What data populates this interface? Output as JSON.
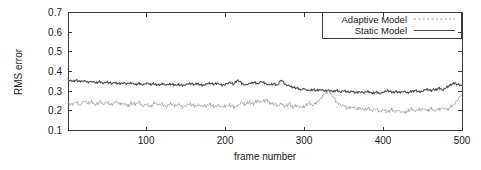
{
  "chart_data": {
    "type": "line",
    "title": "",
    "xlabel": "frame number",
    "ylabel": "RMS error",
    "xlim": [
      1,
      500
    ],
    "ylim": [
      0.1,
      0.7
    ],
    "grid": false,
    "legend_position": "top-right",
    "xticks": [
      100,
      200,
      300,
      400,
      500
    ],
    "xtick_labels": [
      "100",
      "200",
      "300",
      "400",
      "500"
    ],
    "yticks": [
      0.1,
      0.2,
      0.3,
      0.4,
      0.5,
      0.6,
      0.7
    ],
    "ytick_labels": [
      "0.1",
      "0.2",
      "0.3",
      "0.4",
      "0.5",
      "0.6",
      "0.7"
    ],
    "series": [
      {
        "name": "Adaptive Model",
        "style": "dotted",
        "color": "#9a9a9a",
        "x": [
          1,
          6,
          11,
          16,
          21,
          26,
          31,
          36,
          41,
          46,
          51,
          56,
          61,
          66,
          71,
          76,
          81,
          86,
          91,
          96,
          101,
          106,
          111,
          116,
          121,
          126,
          131,
          136,
          141,
          146,
          151,
          156,
          161,
          166,
          171,
          176,
          181,
          186,
          191,
          196,
          201,
          206,
          211,
          216,
          221,
          226,
          231,
          236,
          241,
          246,
          251,
          256,
          261,
          266,
          271,
          276,
          281,
          286,
          291,
          296,
          301,
          306,
          311,
          316,
          321,
          326,
          331,
          336,
          341,
          346,
          351,
          356,
          361,
          366,
          371,
          376,
          381,
          386,
          391,
          396,
          401,
          406,
          411,
          416,
          421,
          426,
          431,
          436,
          441,
          446,
          451,
          456,
          461,
          466,
          471,
          476,
          481,
          486,
          491,
          496,
          500
        ],
        "values": [
          0.24,
          0.228,
          0.246,
          0.232,
          0.251,
          0.237,
          0.244,
          0.23,
          0.248,
          0.236,
          0.242,
          0.229,
          0.247,
          0.234,
          0.24,
          0.226,
          0.238,
          0.231,
          0.243,
          0.227,
          0.235,
          0.222,
          0.24,
          0.228,
          0.234,
          0.221,
          0.238,
          0.226,
          0.232,
          0.219,
          0.229,
          0.236,
          0.224,
          0.231,
          0.218,
          0.227,
          0.235,
          0.222,
          0.229,
          0.216,
          0.224,
          0.233,
          0.22,
          0.228,
          0.241,
          0.23,
          0.246,
          0.235,
          0.252,
          0.243,
          0.255,
          0.246,
          0.238,
          0.228,
          0.236,
          0.224,
          0.232,
          0.22,
          0.228,
          0.217,
          0.225,
          0.238,
          0.226,
          0.246,
          0.262,
          0.285,
          0.302,
          0.275,
          0.248,
          0.232,
          0.224,
          0.212,
          0.22,
          0.208,
          0.216,
          0.205,
          0.213,
          0.201,
          0.209,
          0.198,
          0.206,
          0.196,
          0.204,
          0.194,
          0.202,
          0.192,
          0.2,
          0.208,
          0.198,
          0.206,
          0.212,
          0.202,
          0.21,
          0.2,
          0.208,
          0.216,
          0.206,
          0.222,
          0.238,
          0.262,
          0.281
        ]
      },
      {
        "name": "Static Model",
        "style": "solid",
        "color": "#4a4a4a",
        "x": [
          1,
          6,
          11,
          16,
          21,
          26,
          31,
          36,
          41,
          46,
          51,
          56,
          61,
          66,
          71,
          76,
          81,
          86,
          91,
          96,
          101,
          106,
          111,
          116,
          121,
          126,
          131,
          136,
          141,
          146,
          151,
          156,
          161,
          166,
          171,
          176,
          181,
          186,
          191,
          196,
          201,
          206,
          211,
          216,
          221,
          226,
          231,
          236,
          241,
          246,
          251,
          256,
          261,
          266,
          271,
          276,
          281,
          286,
          291,
          296,
          301,
          306,
          311,
          316,
          321,
          326,
          331,
          336,
          341,
          346,
          351,
          356,
          361,
          366,
          371,
          376,
          381,
          386,
          391,
          396,
          401,
          406,
          411,
          416,
          421,
          426,
          431,
          436,
          441,
          446,
          451,
          456,
          461,
          466,
          471,
          476,
          481,
          486,
          491,
          496,
          500
        ],
        "values": [
          0.36,
          0.352,
          0.357,
          0.348,
          0.353,
          0.345,
          0.35,
          0.343,
          0.348,
          0.341,
          0.346,
          0.339,
          0.344,
          0.338,
          0.343,
          0.336,
          0.341,
          0.335,
          0.34,
          0.334,
          0.339,
          0.333,
          0.338,
          0.332,
          0.337,
          0.331,
          0.336,
          0.33,
          0.335,
          0.329,
          0.334,
          0.34,
          0.332,
          0.338,
          0.33,
          0.336,
          0.342,
          0.334,
          0.339,
          0.331,
          0.337,
          0.343,
          0.335,
          0.355,
          0.341,
          0.333,
          0.339,
          0.345,
          0.337,
          0.348,
          0.34,
          0.332,
          0.338,
          0.33,
          0.356,
          0.336,
          0.328,
          0.321,
          0.314,
          0.306,
          0.312,
          0.304,
          0.31,
          0.302,
          0.308,
          0.3,
          0.306,
          0.298,
          0.304,
          0.296,
          0.302,
          0.294,
          0.3,
          0.292,
          0.298,
          0.291,
          0.297,
          0.29,
          0.296,
          0.289,
          0.295,
          0.302,
          0.293,
          0.3,
          0.292,
          0.299,
          0.291,
          0.298,
          0.305,
          0.296,
          0.303,
          0.31,
          0.301,
          0.308,
          0.316,
          0.306,
          0.322,
          0.332,
          0.34,
          0.334,
          0.328
        ]
      }
    ]
  },
  "legend": {
    "entries": [
      {
        "label": "Adaptive Model"
      },
      {
        "label": "Static Model"
      }
    ]
  }
}
